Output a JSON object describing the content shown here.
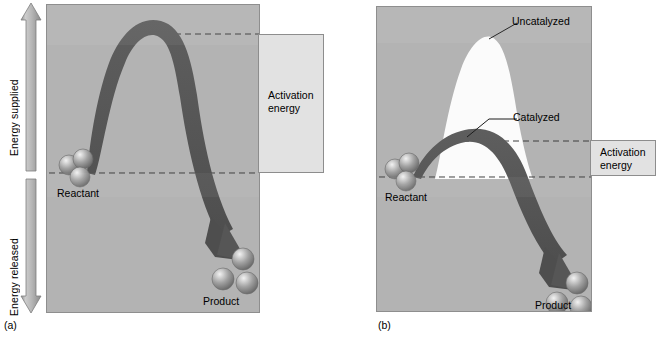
{
  "figure": {
    "axis": {
      "energy_supplied_label": "Energy supplied",
      "energy_released_label": "Energy released",
      "up_arrow_icon": "arrow-up-icon",
      "down_arrow_icon": "arrow-down-icon"
    },
    "panel_a": {
      "caption": "(a)",
      "reactant_label": "Reactant",
      "product_label": "Product",
      "activation_energy_label": "Activation\nenergy",
      "activation_energy_line1": "Activation",
      "activation_energy_line2": "energy",
      "reaction_arrow_icon": "reaction-curve-arrow-icon",
      "reactant_molecule_icon": "reactant-molecule-icon",
      "product_molecule_icon": "product-molecule-icon"
    },
    "panel_b": {
      "caption": "(b)",
      "reactant_label": "Reactant",
      "product_label": "Product",
      "uncatalyzed_label": "Uncatalyzed",
      "catalyzed_label": "Catalyzed",
      "activation_energy_line1": "Activation",
      "activation_energy_line2": "energy",
      "reaction_arrow_icon": "reaction-curve-arrow-icon",
      "uncatalyzed_peak_icon": "uncatalyzed-peak-shape-icon",
      "reactant_molecule_icon": "reactant-molecule-icon",
      "product_molecule_icon": "product-molecule-icon"
    },
    "colors": {
      "panel_background": "#b3b3b3",
      "curve_dark": "#575757",
      "uncatalyzed_white": "#fbfbfb",
      "callout_box": "#e2e2e2",
      "arrow_gray": "#b8b8b8",
      "sphere_gray": "#9a9a9a",
      "dashed_line": "#3c3c3c"
    }
  }
}
